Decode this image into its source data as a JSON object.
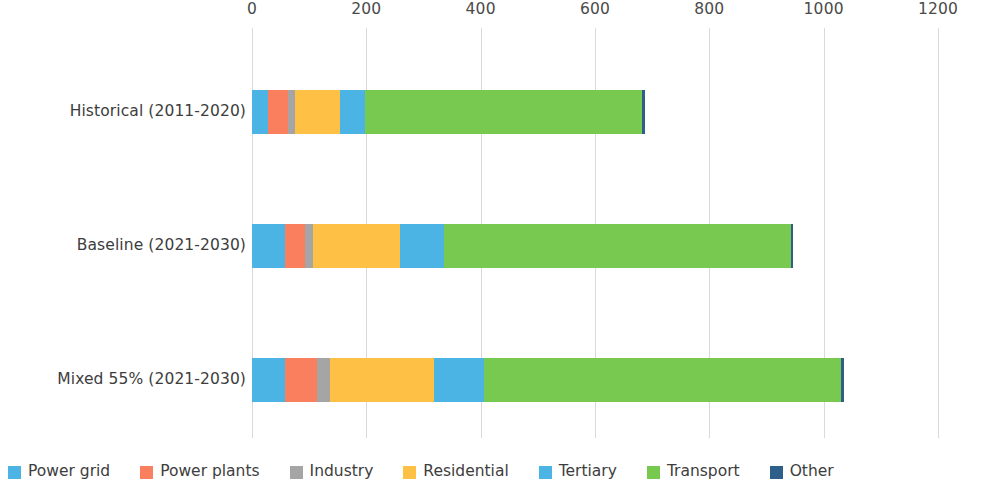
{
  "chart_data": {
    "type": "bar",
    "orientation": "horizontal",
    "stacked": true,
    "title": "",
    "subtitle": "",
    "xlabel": "",
    "ylabel": "",
    "xlim": [
      0,
      1200
    ],
    "xticks": [
      0,
      200,
      400,
      600,
      800,
      1000,
      1200
    ],
    "xtick_labels": [
      "0",
      "200",
      "400",
      "600",
      "800",
      "1000",
      "1200"
    ],
    "grid": true,
    "grid_axis": "x",
    "legend_position": "bottom",
    "categories": [
      "Historical (2011-2020)",
      "Baseline (2021-2030)",
      "Mixed 55% (2021-2030)"
    ],
    "series": [
      {
        "name": "Power grid",
        "color": "#4cb3e5",
        "values": [
          28,
          58,
          58
        ]
      },
      {
        "name": "Power plants",
        "color": "#f97f5f",
        "values": [
          35,
          35,
          56
        ]
      },
      {
        "name": "Industry",
        "color": "#a5a5a5",
        "values": [
          12,
          14,
          23
        ]
      },
      {
        "name": "Residential",
        "color": "#ffc145",
        "values": [
          79,
          152,
          182
        ]
      },
      {
        "name": "Tertiary",
        "color": "#4cb3e5",
        "values": [
          44,
          77,
          86
        ]
      },
      {
        "name": "Transport",
        "color": "#77c94f",
        "values": [
          484,
          606,
          625
        ]
      },
      {
        "name": "Other",
        "color": "#2e5f8a",
        "values": [
          5,
          4,
          5
        ]
      }
    ],
    "totals": [
      687,
      946,
      1035
    ]
  },
  "legend": {
    "items": [
      {
        "label": "Power grid",
        "color": "#4cb3e5"
      },
      {
        "label": "Power plants",
        "color": "#f97f5f"
      },
      {
        "label": "Industry",
        "color": "#a5a5a5"
      },
      {
        "label": "Residential",
        "color": "#ffc145"
      },
      {
        "label": "Tertiary",
        "color": "#4cb3e5"
      },
      {
        "label": "Transport",
        "color": "#77c94f"
      },
      {
        "label": "Other",
        "color": "#2e5f8a"
      }
    ]
  },
  "axis": {
    "tick_labels": [
      "0",
      "200",
      "400",
      "600",
      "800",
      "1000",
      "1200"
    ]
  },
  "category_labels": [
    "Historical (2011-2020)",
    "Baseline (2021-2030)",
    "Mixed 55% (2021-2030)"
  ]
}
